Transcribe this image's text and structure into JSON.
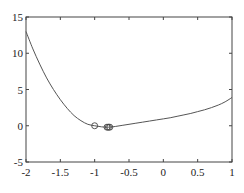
{
  "chart_data": {
    "type": "line",
    "title": "",
    "xlabel": "",
    "ylabel": "",
    "xlim": [
      -2,
      1
    ],
    "ylim": [
      -5,
      15
    ],
    "xticks": [
      -2,
      -1.5,
      -1,
      -0.5,
      0,
      0.5,
      1
    ],
    "xtick_labels": [
      "-2",
      "-1.5",
      "-1",
      "-0.5",
      "0",
      "0.5",
      "1"
    ],
    "yticks": [
      -5,
      0,
      5,
      10,
      15
    ],
    "ytick_labels": [
      "-5",
      "0",
      "5",
      "10",
      "15"
    ],
    "grid": false,
    "series": [
      {
        "name": "curve",
        "color": "#555555",
        "x": [
          -2,
          -1.9,
          -1.8,
          -1.7,
          -1.6,
          -1.5,
          -1.4,
          -1.3,
          -1.2,
          -1.1,
          -1.0,
          -0.9,
          -0.8,
          -0.7,
          -0.6,
          -0.5,
          -0.4,
          -0.3,
          -0.2,
          -0.1,
          0,
          0.1,
          0.2,
          0.3,
          0.4,
          0.5,
          0.6,
          0.7,
          0.8,
          0.9,
          1.0
        ],
        "y": [
          13.0,
          10.6,
          8.5,
          6.6,
          5.0,
          3.6,
          2.4,
          1.4,
          0.7,
          0.2,
          0.0,
          -0.15,
          -0.2,
          -0.1,
          0.05,
          0.2,
          0.35,
          0.5,
          0.65,
          0.8,
          0.95,
          1.1,
          1.3,
          1.5,
          1.7,
          1.95,
          2.2,
          2.5,
          2.85,
          3.3,
          3.9
        ]
      }
    ],
    "markers": {
      "shape": "circle-open",
      "color": "#444444",
      "points": [
        {
          "x": -1.0,
          "y": 0.0
        },
        {
          "x": -0.82,
          "y": -0.2
        },
        {
          "x": -0.8,
          "y": -0.2
        },
        {
          "x": -0.78,
          "y": -0.2
        }
      ]
    }
  }
}
